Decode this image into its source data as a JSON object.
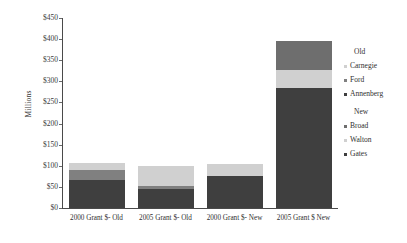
{
  "chart_data": {
    "type": "bar",
    "subtype": "stacked-bar",
    "title": "",
    "xlabel": "",
    "ylabel": "Millions",
    "ylim": [
      0,
      450
    ],
    "ytick_step": 50,
    "grid": false,
    "legend_position": "right",
    "categories": [
      "2000 Grant $- Old",
      "2005 Grant $- Old",
      "2000 Grant $- New",
      "2005 Grant $ New"
    ],
    "ytick_labels": [
      "$0",
      "$50",
      "$100",
      "$150",
      "$200",
      "$250",
      "$300",
      "$350",
      "$400",
      "$450"
    ],
    "ytick_values": [
      0,
      50,
      100,
      150,
      200,
      250,
      300,
      350,
      400,
      450
    ],
    "series": [
      {
        "name": "Annenberg",
        "group": "Old",
        "color": "#3f3f3f",
        "values": [
          67,
          45,
          0,
          0
        ]
      },
      {
        "name": "Ford",
        "group": "Old",
        "color": "#808080",
        "values": [
          23,
          7,
          0,
          0
        ]
      },
      {
        "name": "Carnegie",
        "group": "Old",
        "color": "#d0d0d0",
        "values": [
          17,
          48,
          0,
          0
        ]
      },
      {
        "name": "Gates",
        "group": "New",
        "color": "#3f3f3f",
        "values": [
          0,
          0,
          75,
          285
        ]
      },
      {
        "name": "Walton",
        "group": "New",
        "color": "#d0d0d0",
        "values": [
          0,
          0,
          30,
          43
        ]
      },
      {
        "name": "Broad",
        "group": "New",
        "color": "#6e6e6e",
        "values": [
          0,
          0,
          0,
          67
        ]
      }
    ],
    "bar_totals": [
      107,
      100,
      105,
      395
    ]
  },
  "legend": {
    "groups": [
      {
        "title": "Old",
        "entries": [
          {
            "label": "Carnegie",
            "color": "#d0d0d0"
          },
          {
            "label": "Ford",
            "color": "#808080"
          },
          {
            "label": "Annenberg",
            "color": "#3f3f3f"
          }
        ]
      },
      {
        "title": "New",
        "entries": [
          {
            "label": "Broad",
            "color": "#6e6e6e"
          },
          {
            "label": "Walton",
            "color": "#d0d0d0"
          },
          {
            "label": "Gates",
            "color": "#3f3f3f"
          }
        ]
      }
    ]
  },
  "axis": {
    "y_title": "Millions"
  },
  "colors": {
    "axis": "#4a4a4a",
    "text": "#2f2f2f",
    "background": "#ffffff"
  }
}
